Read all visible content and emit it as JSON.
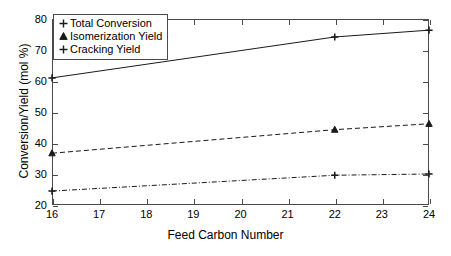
{
  "chart_data": {
    "type": "line",
    "title": "",
    "subtitle": "",
    "xlabel": "Feed Carbon Number",
    "ylabel": "Conversion/Yield (mol %)",
    "xlim": [
      16,
      24
    ],
    "ylim": [
      20,
      80
    ],
    "xticks": [
      16,
      17,
      18,
      19,
      20,
      21,
      22,
      23,
      24
    ],
    "yticks": [
      20,
      30,
      40,
      50,
      60,
      70,
      80
    ],
    "xticklabels": [
      "16",
      "17",
      "18",
      "19",
      "20",
      "21",
      "22",
      "23",
      "24"
    ],
    "yticklabels": [
      "20",
      "30",
      "40",
      "50",
      "60",
      "70",
      "80"
    ],
    "grid": false,
    "legend_position": "upper-left-inside",
    "x": [
      16,
      22,
      24
    ],
    "series": [
      {
        "name": "Total Conversion",
        "values": [
          61.0,
          74.2,
          76.4
        ],
        "linestyle": "solid",
        "marker": "plus",
        "color": "#1a1a1a"
      },
      {
        "name": "Isomerization Yield",
        "values": [
          36.7,
          44.3,
          46.2
        ],
        "linestyle": "dashed",
        "marker": "triangle",
        "color": "#1a1a1a"
      },
      {
        "name": "Cracking Yield",
        "values": [
          24.5,
          29.6,
          30.0
        ],
        "linestyle": "dashdot",
        "marker": "plus",
        "color": "#1a1a1a"
      }
    ]
  },
  "legend": {
    "entries": [
      {
        "label": "Total Conversion"
      },
      {
        "label": "Isomerization Yield"
      },
      {
        "label": "Cracking Yield"
      }
    ]
  },
  "colors": {
    "axis": "#4a4a4a",
    "line": "#1a1a1a",
    "background": "#ffffff"
  }
}
